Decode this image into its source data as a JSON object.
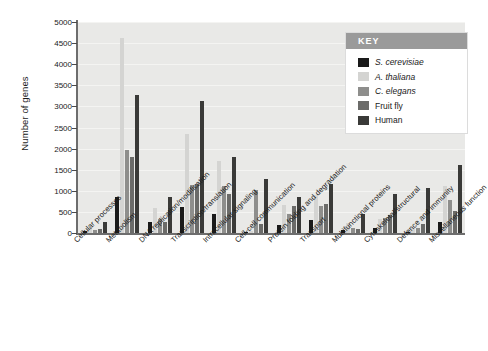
{
  "chart_data": {
    "type": "bar",
    "title": "",
    "xlabel": "",
    "ylabel": "Number of genes",
    "ylim": [
      0,
      5000
    ],
    "yticks": [
      0,
      500,
      1000,
      1500,
      2000,
      2500,
      3000,
      3500,
      4000,
      4500,
      5000
    ],
    "grid": true,
    "legend_position": "top-right",
    "legend_title": "KEY",
    "categories": [
      "Cellular processes",
      "Metabolism",
      "DNA replication/modification",
      "Transcription/translation",
      "Intracellular signaling",
      "Cell-cell communication",
      "Protein folding and degradation",
      "Transport",
      "Multifunctional proteins",
      "Cytoskeletal/structural",
      "Defence and immunity",
      "Miscellaneous function"
    ],
    "series": [
      {
        "name": "S. cerevisiae",
        "italic": true,
        "color": "#1a1a1a",
        "values": [
          55,
          860,
          260,
          610,
          450,
          20,
          180,
          310,
          60,
          110,
          30,
          250
        ]
      },
      {
        "name": "A. thaliana",
        "italic": true,
        "color": "#d4d4d2",
        "values": [
          130,
          4620,
          590,
          2340,
          1710,
          50,
          670,
          910,
          230,
          330,
          130,
          1110
        ]
      },
      {
        "name": "C. elegans",
        "italic": true,
        "color": "#8e8e8c",
        "values": [
          80,
          1960,
          330,
          1130,
          1120,
          1010,
          440,
          645,
          120,
          350,
          130,
          790
        ]
      },
      {
        "name": "Fruit fly",
        "italic": false,
        "color": "#6b6b69",
        "values": [
          85,
          1800,
          270,
          1170,
          930,
          215,
          630,
          690,
          100,
          425,
          215,
          530
        ]
      },
      {
        "name": "Human",
        "italic": false,
        "color": "#3a3a38",
        "values": [
          265,
          3280,
          860,
          3140,
          1810,
          1270,
          855,
          1170,
          450,
          915,
          1070,
          1610
        ]
      }
    ]
  }
}
